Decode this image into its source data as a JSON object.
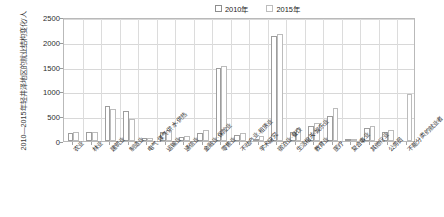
{
  "chart_data": {
    "type": "bar",
    "title": "",
    "ylabel": "2010—2015年轻井泽地区的就业结构变化/人",
    "xlabel": "",
    "ylim": [
      0,
      2500
    ],
    "yticks": [
      0,
      500,
      1000,
      1500,
      2000,
      2500
    ],
    "ytick_labels": [
      "0",
      "500",
      "1000",
      "1500",
      "2000",
      "2500"
    ],
    "grid": true,
    "legend_position": "top-right-inside",
    "categories": [
      "农业",
      "林业",
      "建筑业",
      "制造业",
      "电气·煤气·供水·供热",
      "运输业",
      "通信业",
      "金融业·保险业",
      "零售业",
      "不动产业·租赁业",
      "学术研究",
      "宿泊业·餐饮",
      "生活相关·娱乐业",
      "教育业",
      "医疗",
      "复合事业",
      "其他行业",
      "公务员",
      "不能分类的就业者"
    ],
    "series": [
      {
        "name": "2010年",
        "values": [
          170,
          175,
          700,
          600,
          60,
          190,
          75,
          165,
          1470,
          120,
          40,
          2120,
          190,
          300,
          500,
          30,
          260,
          180,
          0
        ]
      },
      {
        "name": "2015年",
        "values": [
          175,
          180,
          640,
          450,
          55,
          215,
          100,
          230,
          1510,
          160,
          110,
          2150,
          255,
          370,
          660,
          50,
          300,
          230,
          950
        ]
      }
    ],
    "legend": [
      "2010年",
      "2015年"
    ],
    "colors": {
      "series_2010_edge": "#9d9d9d",
      "series_2015_edge": "#bcbcbc",
      "fill": "#ffffff",
      "grid": "#d8d8d8",
      "frame": "#b9b9b9",
      "text": "#2b2b2b"
    }
  }
}
